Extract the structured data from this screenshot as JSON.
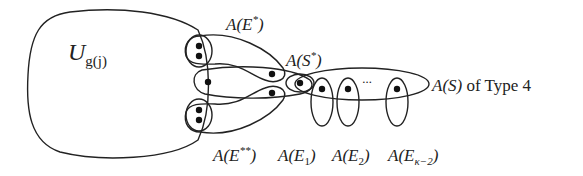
{
  "diagram": {
    "type": "hypergraph-illustration",
    "labels": {
      "universe": {
        "main": "U",
        "sub": "g(j)"
      },
      "e_star": {
        "text": "A(E",
        "sup": "*",
        "close": ")"
      },
      "s_star": {
        "text": "A(S",
        "sup": "*",
        "close": ")"
      },
      "s_type": {
        "text": "A(S)",
        "suffix": " of Type 4"
      },
      "e_double_star": {
        "text": "A(E",
        "sup": "**",
        "close": ")"
      },
      "e1": {
        "text": "A(E",
        "sub": "1",
        "close": ")"
      },
      "e2": {
        "text": "A(E",
        "sub": "2",
        "close": ")"
      },
      "ek2": {
        "text": "A(E",
        "sub": "κ−2",
        "close": ")"
      },
      "ellipsis": "···"
    },
    "colors": {
      "stroke": "#222222",
      "dot": "#111111",
      "background": "#ffffff"
    }
  }
}
